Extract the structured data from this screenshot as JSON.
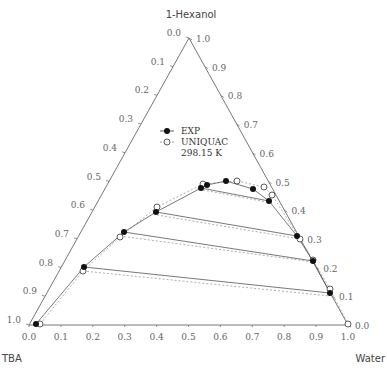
{
  "chart_data": {
    "type": "ternary-scatter",
    "title": "",
    "vertices": {
      "top": "1-Hexanol",
      "left": "TBA",
      "right": "Water"
    },
    "legend": [
      {
        "marker": "filled-circle",
        "label": "EXP"
      },
      {
        "marker": "open-circle",
        "label": "UNIQUAC"
      }
    ],
    "legend_note": "298.15 K",
    "left_axis_ticks": [
      "0.0",
      "0.1",
      "0.2",
      "0.3",
      "0.4",
      "0.5",
      "0.6",
      "0.7",
      "0.8",
      "0.9",
      "1.0"
    ],
    "right_axis_ticks": [
      "1.0",
      "0.9",
      "0.8",
      "0.7",
      "0.6",
      "0.5",
      "0.4",
      "0.3",
      "0.2",
      "0.1",
      "0.0"
    ],
    "bottom_axis_ticks": [
      "0.0",
      "0.1",
      "0.2",
      "0.3",
      "0.4",
      "0.5",
      "0.6",
      "0.7",
      "0.8",
      "0.9",
      "1.0"
    ],
    "exp_points_px": [
      [
        36,
        324
      ],
      [
        84,
        267
      ],
      [
        124,
        232
      ],
      [
        156,
        212
      ],
      [
        201,
        188
      ],
      [
        207,
        185
      ],
      [
        226,
        181
      ],
      [
        253,
        189
      ],
      [
        269,
        201
      ],
      [
        297,
        236
      ],
      [
        313,
        261
      ],
      [
        330,
        293
      ]
    ],
    "uniquac_points_px": [
      [
        40,
        324
      ],
      [
        83,
        271
      ],
      [
        120,
        237
      ],
      [
        157,
        207
      ],
      [
        203,
        184
      ],
      [
        237,
        181
      ],
      [
        264,
        187
      ],
      [
        272,
        195
      ],
      [
        300,
        239
      ],
      [
        313,
        260
      ],
      [
        330,
        289
      ],
      [
        348,
        324
      ]
    ],
    "tie_lines_exp_px": [
      [
        [
          201,
          188
        ],
        [
          269,
          201
        ]
      ],
      [
        [
          156,
          212
        ],
        [
          297,
          236
        ]
      ],
      [
        [
          124,
          232
        ],
        [
          313,
          261
        ]
      ],
      [
        [
          84,
          267
        ],
        [
          330,
          293
        ]
      ]
    ],
    "tie_lines_calc_px": [
      [
        [
          203,
          190
        ],
        [
          272,
          203
        ]
      ],
      [
        [
          157,
          215
        ],
        [
          300,
          239
        ]
      ],
      [
        [
          120,
          236
        ],
        [
          313,
          262
        ]
      ],
      [
        [
          83,
          271
        ],
        [
          330,
          296
        ]
      ]
    ]
  },
  "labels": {
    "top": "1-Hexanol",
    "left": "TBA",
    "right": "Water",
    "legend_exp": "EXP",
    "legend_calc": "UNIQUAC",
    "legend_temp": "298.15 K"
  }
}
